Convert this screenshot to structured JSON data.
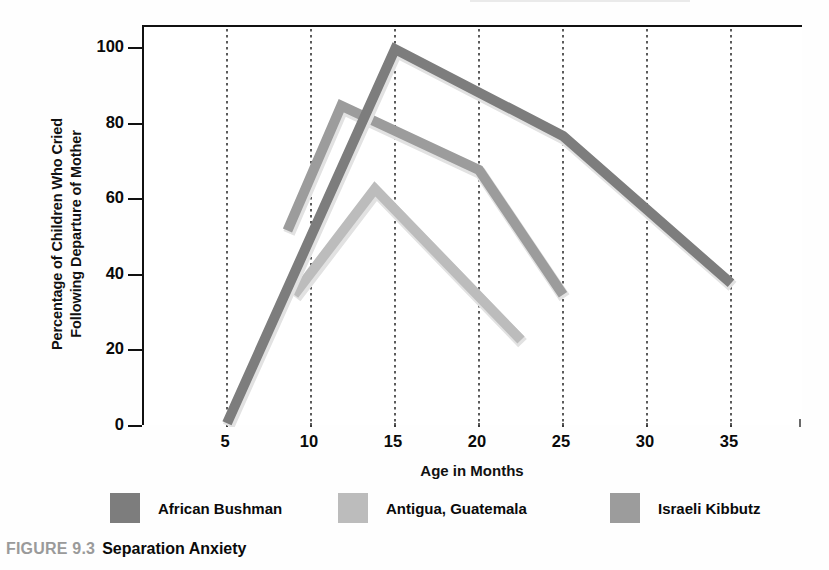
{
  "caption": {
    "figure_number": "FIGURE 9.3",
    "title": "Separation Anxiety"
  },
  "chart_data": {
    "type": "line",
    "title": "Separation Anxiety",
    "xlabel": "Age in Months",
    "ylabel_line1": "Percentage of Children Who Cried",
    "ylabel_line2": "Following Departure of Mother",
    "ylabel": "Percentage of Children Who Cried Following Departure of Mother",
    "xlim": [
      3,
      38
    ],
    "ylim": [
      0,
      106
    ],
    "xticks": [
      5,
      10,
      15,
      20,
      25,
      30,
      35
    ],
    "xtick_labels": [
      "5",
      "10",
      "15",
      "20",
      "25",
      "30",
      "35"
    ],
    "yticks": [
      0,
      20,
      40,
      60,
      80,
      100
    ],
    "ytick_labels": [
      "0",
      "20",
      "40",
      "60",
      "80",
      "100"
    ],
    "grid": "vertical-dotted",
    "legend_position": "below-axis",
    "series": [
      {
        "name": "African Bushman",
        "color": "#7d7d7d",
        "x": [
          5,
          15,
          25,
          35
        ],
        "y": [
          1,
          100,
          77,
          38
        ]
      },
      {
        "name": "Antigua, Guatemala",
        "color": "#bcbcbc",
        "x": [
          9,
          13.8,
          22.5
        ],
        "y": [
          35,
          63,
          23
        ]
      },
      {
        "name": "Israeli Kibbutz",
        "color": "#9c9c9c",
        "x": [
          8.6,
          11.8,
          20,
          25
        ],
        "y": [
          52,
          85,
          68,
          35
        ]
      }
    ]
  },
  "legend": {
    "entries": [
      {
        "label": "African Bushman",
        "color": "#7d7d7d",
        "left": 0
      },
      {
        "label": "Antigua, Guatemala",
        "color": "#bcbcbc",
        "left": 228
      },
      {
        "label": "Israeli Kibbutz",
        "color": "#9c9c9c",
        "left": 500
      }
    ]
  }
}
